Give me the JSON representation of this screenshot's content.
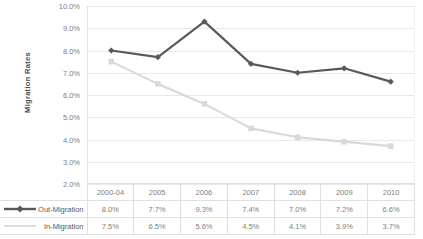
{
  "chart_data": {
    "type": "line",
    "title": "",
    "xlabel": "",
    "ylabel": "Migration Rates",
    "categories": [
      "2000-04",
      "2005",
      "2006",
      "2007",
      "2008",
      "2009",
      "2010"
    ],
    "ylim": [
      2.0,
      10.0
    ],
    "ytick_labels": [
      "10.0%",
      "9.0%",
      "8.0%",
      "7.0%",
      "6.0%",
      "5.0%",
      "4.0%",
      "3.0%",
      "2.0%"
    ],
    "ytick_values": [
      10.0,
      9.0,
      8.0,
      7.0,
      6.0,
      5.0,
      4.0,
      3.0,
      2.0
    ],
    "grid": true,
    "legend_position": "data-table-left",
    "series": [
      {
        "name": "Out-Migration",
        "color": "#595959",
        "marker": "diamond",
        "values": [
          8.0,
          7.7,
          9.3,
          7.4,
          7.0,
          7.2,
          6.6
        ],
        "labels": [
          "8.0%",
          "7.7%",
          "9.3%",
          "7.4%",
          "7.0%",
          "7.2%",
          "6.6%"
        ]
      },
      {
        "name": "In-Migration",
        "color": "#d9d9d9",
        "marker": "square",
        "values": [
          7.5,
          6.5,
          5.6,
          4.5,
          4.1,
          3.9,
          3.7
        ],
        "labels": [
          "7.5%",
          "6.5%",
          "5.6%",
          "4.5%",
          "4.1%",
          "3.9%",
          "3.7%"
        ]
      }
    ]
  },
  "colors": {
    "out_migration": "#595959",
    "in_migration": "#d9d9d9",
    "gridline": "#e8e8e8",
    "axis_text": "#808080",
    "table_border": "#e0e0e0",
    "background": "#ffffff"
  }
}
